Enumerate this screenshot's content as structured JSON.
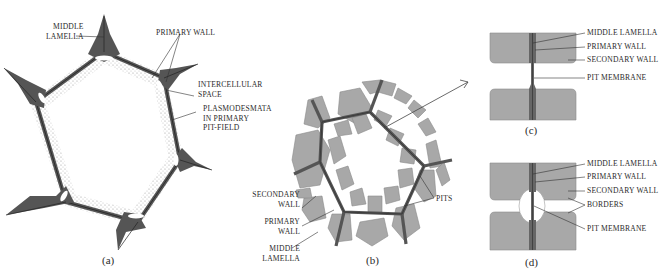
{
  "figure": {
    "colors": {
      "wall_dark": "#555555",
      "cell_fill": "#a8a8a8",
      "cell_stroke": "#7a7a7a",
      "lamella_line": "#333333",
      "stipple": "#9a9a9a",
      "text": "#2a2a2a",
      "background": "#ffffff"
    },
    "panels": {
      "a": {
        "caption": "(a)",
        "labels": {
          "middle_lamella_1": "MIDDLE",
          "middle_lamella_2": "LAMELLA",
          "primary_wall": "PRIMARY WALL",
          "intercellular_1": "INTERCELLULAR",
          "intercellular_2": "SPACE",
          "plasmodesmata_1": "PLASMODESMATA",
          "plasmodesmata_2": "IN PRIMARY",
          "plasmodesmata_3": "PIT-FIELD"
        }
      },
      "b": {
        "caption": "(b)",
        "labels": {
          "secondary_wall_1": "SECONDARY",
          "secondary_wall_2": "WALL",
          "primary_wall_1": "PRIMARY",
          "primary_wall_2": "WALL",
          "middle_lamella_1": "MIDDLE",
          "middle_lamella_2": "LAMELLA",
          "pits": "PITS"
        }
      },
      "c": {
        "caption": "(c)",
        "labels": {
          "middle_lamella": "MIDDLE LAMELLA",
          "primary_wall": "PRIMARY WALL",
          "secondary_wall": "SECONDARY WALL",
          "pit_membrane": "PIT MEMBRANE"
        }
      },
      "d": {
        "caption": "(d)",
        "labels": {
          "middle_lamella": "MIDDLE LAMELLA",
          "primary_wall": "PRIMARY WALL",
          "secondary_wall": "SECONDARY WALL",
          "borders": "BORDERS",
          "pit_membrane": "PIT MEMBRANE"
        }
      }
    }
  }
}
